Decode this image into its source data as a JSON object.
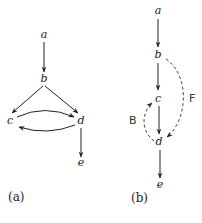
{
  "diagrams": [
    {
      "caption": "(a)",
      "nodes": [
        "a",
        "b",
        "c",
        "d",
        "e"
      ],
      "edges": [
        {
          "from": "a",
          "to": "b",
          "style": "solid"
        },
        {
          "from": "b",
          "to": "c",
          "style": "solid"
        },
        {
          "from": "b",
          "to": "d",
          "style": "solid"
        },
        {
          "from": "c",
          "to": "d",
          "style": "solid",
          "curved": true
        },
        {
          "from": "d",
          "to": "c",
          "style": "solid",
          "curved": true
        },
        {
          "from": "d",
          "to": "e",
          "style": "solid"
        }
      ]
    },
    {
      "caption": "(b)",
      "nodes": [
        "a",
        "b",
        "c",
        "d",
        "e"
      ],
      "edges": [
        {
          "from": "a",
          "to": "b",
          "style": "solid"
        },
        {
          "from": "b",
          "to": "c",
          "style": "solid"
        },
        {
          "from": "c",
          "to": "d",
          "style": "solid"
        },
        {
          "from": "d",
          "to": "e",
          "style": "solid"
        },
        {
          "from": "b",
          "to": "d",
          "style": "dashed",
          "label": "F"
        },
        {
          "from": "d",
          "to": "c",
          "style": "dashed",
          "label": "B"
        }
      ]
    }
  ]
}
